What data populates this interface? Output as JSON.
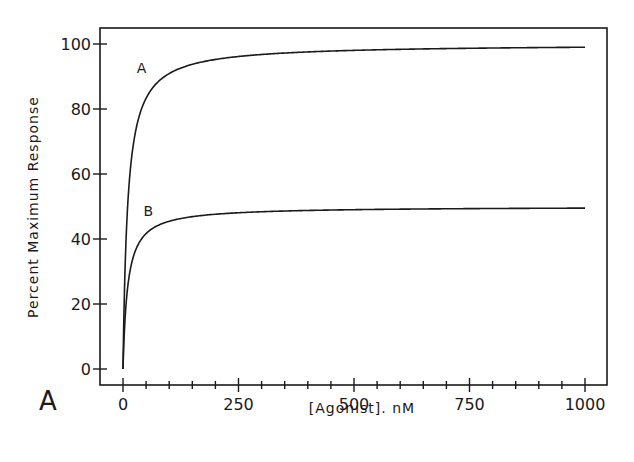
{
  "figure": {
    "panel_label": "A",
    "xlabel": "[Agonist]. nM",
    "ylabel": "Percent Maximum Response"
  },
  "chart_data": {
    "type": "line",
    "title": "",
    "panel_label": "A",
    "xlabel": "[Agonist]. nM",
    "ylabel": "Percent Maximum Response",
    "xlim": [
      -50,
      1050
    ],
    "ylim": [
      -5,
      105
    ],
    "x_ticks": [
      0,
      250,
      500,
      750,
      1000
    ],
    "x_tick_labels": [
      "0",
      "250",
      "500",
      "750",
      "1000"
    ],
    "x_minor_tick_step": 50,
    "y_ticks": [
      0,
      20,
      40,
      60,
      80,
      100
    ],
    "y_tick_labels": [
      "0",
      "20",
      "40",
      "60",
      "80",
      "100"
    ],
    "grid": false,
    "legend": "none (curves labeled inline)",
    "series": [
      {
        "name": "A",
        "model": "hyperbolic Emax*x/(EC50+x)",
        "emax": 100,
        "ec50": 10,
        "x": [
          0,
          5,
          10,
          25,
          50,
          100,
          250,
          500,
          750,
          1000
        ],
        "values": [
          0,
          33,
          50,
          71,
          83,
          91,
          96,
          98,
          99,
          99
        ]
      },
      {
        "name": "B",
        "model": "hyperbolic Emax*x/(EC50+x)",
        "emax": 50,
        "ec50": 10,
        "x": [
          0,
          5,
          10,
          25,
          50,
          100,
          250,
          500,
          750,
          1000
        ],
        "values": [
          0,
          17,
          25,
          36,
          42,
          45,
          48,
          49,
          49.5,
          49.5
        ]
      }
    ],
    "annotations": [
      {
        "text": "A",
        "near_series": "A",
        "x": 40,
        "y": 91
      },
      {
        "text": "B",
        "near_series": "B",
        "x": 55,
        "y": 47
      }
    ]
  }
}
